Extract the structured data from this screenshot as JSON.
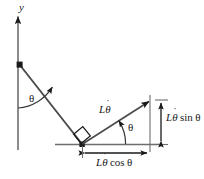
{
  "figure": {
    "name": "pendulum-velocity-components-diagram",
    "width": 204,
    "height": 179,
    "background_color": "#ffffff",
    "stroke_color": "#1a1a1a",
    "labels": {
      "axis_y": "y",
      "angle_rod": "θ",
      "angle_velocity": "θ",
      "velocity_L": "L",
      "velocity_theta": "θ",
      "velocity_dot": "˙",
      "velocity_full": "Lθ̇",
      "vertical_component_L": "L",
      "vertical_component_theta": "θ",
      "vertical_component_fn": "sin",
      "vertical_component_arg": "θ",
      "vertical_component_full": "Lθ̇ sin θ",
      "horizontal_component_L": "L",
      "horizontal_component_theta": "θ",
      "horizontal_component_fn": "cos",
      "horizontal_component_arg": "θ",
      "horizontal_component_full": "Lθ̇ cos θ"
    },
    "geometry": {
      "y_axis_x": 18,
      "y_axis_top": 14,
      "y_axis_bottom": 150,
      "pivot": [
        19,
        64
      ],
      "mass": [
        82,
        144
      ],
      "velocity_tip": [
        150,
        100
      ],
      "ground_line_y": 144,
      "ground_line_x1": 55,
      "ground_line_x2": 162,
      "dim_vertical_x": 161,
      "dim_horizontal_y": 153
    }
  }
}
